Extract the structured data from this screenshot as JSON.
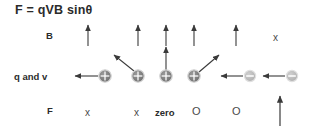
{
  "figure": {
    "title": "F = qVB sinθ",
    "background_color": "#ffffff",
    "text_color": "#2b2b2b",
    "arrow_color": "#3a3a3a",
    "positive_charge_color": "#7a7a7a",
    "negative_charge_color": "#b5b5b5",
    "width": 315,
    "height": 126
  },
  "row_labels": {
    "field": "B",
    "charge_velocity": "q and v",
    "force": "F"
  },
  "field_row": {
    "arrows": [
      {
        "direction": "up",
        "x": 88
      },
      {
        "direction": "up",
        "x": 138
      },
      {
        "direction": "up",
        "x": 166
      },
      {
        "direction": "up",
        "x": 194
      },
      {
        "direction": "up",
        "x": 236
      }
    ],
    "into_page_marker": "x"
  },
  "charges": [
    {
      "sign": "+",
      "glyph": "⊕",
      "velocity": "left",
      "x": 105
    },
    {
      "sign": "+",
      "glyph": "⊕",
      "velocity": "up-left",
      "x": 138
    },
    {
      "sign": "+",
      "glyph": "⊕",
      "velocity": "up",
      "x": 166
    },
    {
      "sign": "+",
      "glyph": "⊕",
      "velocity": "up-right",
      "x": 194
    },
    {
      "sign": "-",
      "glyph": "⊖",
      "velocity": "left",
      "x": 250
    },
    {
      "sign": "-",
      "glyph": "⊖",
      "velocity": "left",
      "x": 292
    }
  ],
  "force_row": {
    "markers": [
      {
        "symbol": "x",
        "meaning": "into-page",
        "bold": false,
        "x": 88
      },
      {
        "symbol": "x",
        "meaning": "into-page",
        "bold": false,
        "x": 137
      },
      {
        "symbol": "zero",
        "meaning": "no-force",
        "bold": true,
        "x": 166
      },
      {
        "symbol": "O",
        "meaning": "out-of-page",
        "bold": false,
        "x": 196
      },
      {
        "symbol": "O",
        "meaning": "out-of-page",
        "bold": false,
        "x": 236
      }
    ],
    "up_arrow_x": 280
  }
}
